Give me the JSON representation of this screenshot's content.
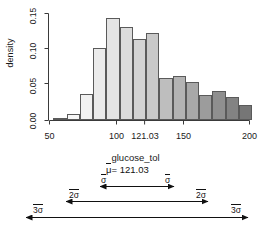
{
  "chart_data": {
    "type": "bar",
    "title": "",
    "subtitle": "",
    "xlabel": "glucose_tol",
    "ylabel": "density",
    "xlim": [
      46,
      203
    ],
    "ylim": [
      0.0,
      0.158
    ],
    "grid": false,
    "legend": null,
    "bin_width": 10,
    "x_ticks": [
      {
        "value": 50,
        "label": "50"
      },
      {
        "value": 100,
        "label": "100"
      },
      {
        "value": 121.03,
        "label": "121.03"
      },
      {
        "value": 150,
        "label": "150"
      },
      {
        "value": 200,
        "label": "200"
      }
    ],
    "y_ticks": [
      {
        "value": 0.0,
        "label": "0.00"
      },
      {
        "value": 0.05,
        "label": "0.05"
      },
      {
        "value": 0.1,
        "label": "0.10"
      },
      {
        "value": 0.15,
        "label": "0.15"
      }
    ],
    "bins": [
      {
        "x0": 50,
        "x1": 60,
        "density": 0.002,
        "fill": "#fbfbfb"
      },
      {
        "x0": 60,
        "x1": 70,
        "density": 0.009,
        "fill": "#f7f7f7"
      },
      {
        "x0": 70,
        "x1": 80,
        "density": 0.038,
        "fill": "#f1f1f1"
      },
      {
        "x0": 80,
        "x1": 90,
        "density": 0.106,
        "fill": "#ebebeb"
      },
      {
        "x0": 90,
        "x1": 100,
        "density": 0.149,
        "fill": "#e4e4e4"
      },
      {
        "x0": 100,
        "x1": 110,
        "density": 0.136,
        "fill": "#dcdcdc"
      },
      {
        "x0": 110,
        "x1": 120,
        "density": 0.118,
        "fill": "#d3d3d3"
      },
      {
        "x0": 120,
        "x1": 130,
        "density": 0.127,
        "fill": "#c9c9c9"
      },
      {
        "x0": 130,
        "x1": 140,
        "density": 0.062,
        "fill": "#bebebe"
      },
      {
        "x0": 140,
        "x1": 150,
        "density": 0.064,
        "fill": "#b3b3b3"
      },
      {
        "x0": 150,
        "x1": 160,
        "density": 0.056,
        "fill": "#a8a8a8"
      },
      {
        "x0": 160,
        "x1": 170,
        "density": 0.036,
        "fill": "#9c9c9c"
      },
      {
        "x0": 170,
        "x1": 180,
        "density": 0.042,
        "fill": "#8f8f8f"
      },
      {
        "x0": 180,
        "x1": 190,
        "density": 0.033,
        "fill": "#838383"
      },
      {
        "x0": 190,
        "x1": 200,
        "density": 0.022,
        "fill": "#767676"
      }
    ]
  },
  "sigma_diagram": {
    "mean_label": "= 121.03",
    "mean_symbol": "μ",
    "sigma_symbol": "σ",
    "arrows": [
      {
        "name": "one-sigma",
        "left_label": "σ",
        "right_label": "σ",
        "span": 1
      },
      {
        "name": "two-sigma",
        "left_label": "2σ",
        "right_label": "2σ",
        "span": 2
      },
      {
        "name": "three-sigma",
        "left_label": "3σ",
        "right_label": "3σ",
        "span": 3
      }
    ]
  },
  "colors": {
    "axis": "#3a3a3a",
    "text": "#1a1a1a",
    "bar_stroke": "#5a5a5a",
    "background": "#ffffff"
  }
}
